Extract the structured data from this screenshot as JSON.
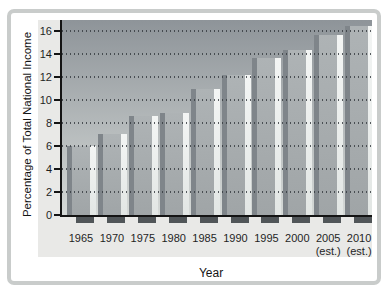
{
  "frame": {
    "background": "#ffffff",
    "border_color": "#c9cccb",
    "panel_color": "#e9e9e7"
  },
  "chart_data": {
    "type": "bar",
    "title": "",
    "xlabel": "Year",
    "ylabel": "Percentage of Total National Income",
    "categories": [
      "1965",
      "1970",
      "1975",
      "1980",
      "1985",
      "1990",
      "1995",
      "2000",
      "2005",
      "2010"
    ],
    "category_notes": [
      "",
      "",
      "",
      "",
      "",
      "",
      "",
      "",
      "(est.)",
      "(est.)"
    ],
    "values": [
      6.0,
      7.1,
      8.6,
      8.9,
      11.0,
      12.2,
      13.7,
      14.4,
      15.7,
      16.5
    ],
    "ylim": [
      0,
      16
    ],
    "yticks": [
      0,
      2,
      4,
      6,
      8,
      10,
      12,
      14,
      16
    ],
    "grid": "dotted horizontal",
    "legend": "none",
    "colors": {
      "plot_bg_top": "#8e9499",
      "plot_bg_bottom": "#d5d9d7",
      "bar_face_top": "#aeb3b5",
      "bar_face_bottom": "#a0a5a7",
      "bar_highlight_top": "#f3f5f4",
      "bar_highlight_bottom": "#e2e6e4",
      "bar_left_shadow": "#7f858a",
      "base_shadow": "#515659",
      "axis": "#141414",
      "gridline": "#32373c",
      "text": "#1f1f1f"
    }
  }
}
